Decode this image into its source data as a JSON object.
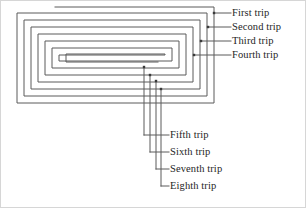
{
  "figure": {
    "background_color": "#ffffff",
    "line_color": "#5a5a5a",
    "text_color": "#252525",
    "frame_color": "#d6d6d6",
    "spiral": {
      "type": "rectangular-inward-spiral",
      "turn_count": 8,
      "stroke_width": 1
    }
  },
  "labels": {
    "right": [
      {
        "id": "first",
        "text": "First trip",
        "x": 232,
        "y": 9,
        "dot_x": 214,
        "dot_y": 13,
        "leader_from_x": 214,
        "leader_to_x": 231,
        "leader_y": 13
      },
      {
        "id": "second",
        "text": "Second trip",
        "x": 232,
        "y": 23,
        "dot_x": 208,
        "dot_y": 27,
        "leader_from_x": 208,
        "leader_to_x": 231,
        "leader_y": 27
      },
      {
        "id": "third",
        "text": "Third trip",
        "x": 232,
        "y": 37,
        "dot_x": 201,
        "dot_y": 41,
        "leader_from_x": 201,
        "leader_to_x": 231,
        "leader_y": 41
      },
      {
        "id": "fourth",
        "text": "Fourth trip",
        "x": 232,
        "y": 51,
        "dot_x": 194,
        "dot_y": 55,
        "leader_from_x": 194,
        "leader_to_x": 231,
        "leader_y": 55
      }
    ],
    "bottom": [
      {
        "id": "fifth",
        "text": "Fifth trip",
        "x": 170,
        "y": 131,
        "dot_x": 144,
        "dot_y": 67,
        "leader_x": 144,
        "leader_y_end": 135,
        "leader_to_x": 169
      },
      {
        "id": "sixth",
        "text": "Sixth trip",
        "x": 170,
        "y": 148,
        "dot_x": 150,
        "dot_y": 75,
        "leader_x": 150,
        "leader_y_end": 152,
        "leader_to_x": 169
      },
      {
        "id": "seventh",
        "text": "Seventh trip",
        "x": 170,
        "y": 165,
        "dot_x": 156,
        "dot_y": 81,
        "leader_x": 156,
        "leader_y_end": 169,
        "leader_to_x": 169
      },
      {
        "id": "eighth",
        "text": "Eighth trip",
        "x": 170,
        "y": 182,
        "dot_x": 161,
        "dot_y": 89,
        "leader_x": 161,
        "leader_y_end": 186,
        "leader_to_x": 169
      }
    ]
  }
}
